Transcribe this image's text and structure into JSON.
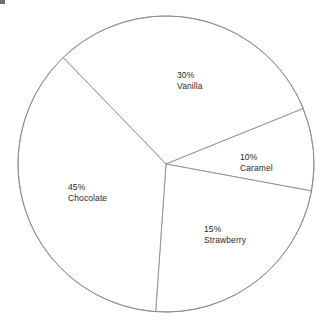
{
  "chart_data": {
    "type": "pie",
    "title": "",
    "categories": [
      "Vanilla",
      "Caramel",
      "Strawberry",
      "Chocolate"
    ],
    "values": [
      30,
      10,
      15,
      45
    ],
    "labels": [
      "30%",
      "10%",
      "15%",
      "45%"
    ],
    "unit": "%",
    "legend": "none",
    "grid": false,
    "slices": [
      {
        "name": "Vanilla",
        "percent": 30,
        "percent_label": "30%",
        "name_label": "Vanilla",
        "start_angle_deg": 134.0,
        "end_angle_deg": 22.0,
        "fill": "#ffffff",
        "stroke": "#8c8c8c"
      },
      {
        "name": "Caramel",
        "percent": 10,
        "percent_label": "10%",
        "name_label": "Caramel",
        "start_angle_deg": 22.0,
        "end_angle_deg": -10.5,
        "fill": "#ffffff",
        "stroke": "#8c8c8c"
      },
      {
        "name": "Strawberry",
        "percent": 15,
        "percent_label": "15%",
        "name_label": "Strawberry",
        "start_angle_deg": -10.5,
        "end_angle_deg": -94.0,
        "fill": "#ffffff",
        "stroke": "#8c8c8c"
      },
      {
        "name": "Chocolate",
        "percent": 45,
        "percent_label": "45%",
        "name_label": "Chocolate",
        "start_angle_deg": -94.0,
        "end_angle_deg": -226.0,
        "fill": "#ffffff",
        "stroke": "#8c8c8c"
      }
    ],
    "geometry": {
      "cx": 166,
      "cy": 164,
      "r": 148
    },
    "colors": {
      "outline": "#8c8c8c",
      "text": "#2a2a2a",
      "background": "#ffffff"
    }
  }
}
